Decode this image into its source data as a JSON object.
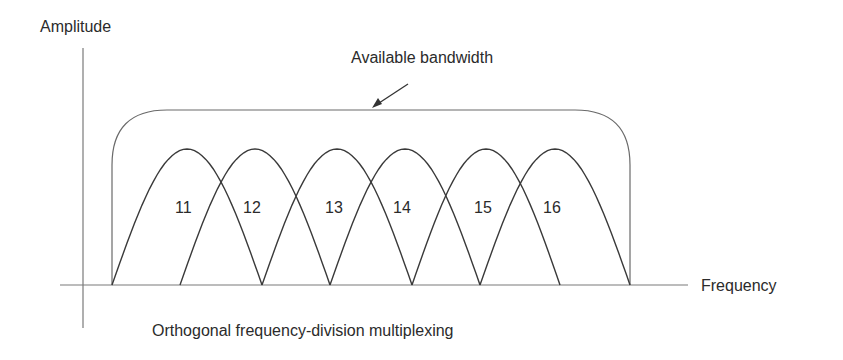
{
  "diagram": {
    "caption": "Orthogonal frequency-division multiplexing",
    "y_axis_label": "Amplitude",
    "x_axis_label": "Frequency",
    "annotation": "Available bandwidth",
    "subcarriers": [
      {
        "label": "11",
        "start": 0,
        "end": 2
      },
      {
        "label": "12",
        "start": 1,
        "end": 3
      },
      {
        "label": "13",
        "start": 2,
        "end": 4
      },
      {
        "label": "14",
        "start": 3,
        "end": 5
      },
      {
        "label": "15",
        "start": 4,
        "end": 6
      },
      {
        "label": "16",
        "start": 5,
        "end": 7
      }
    ],
    "bandwidth": {
      "start": 0,
      "end": 7
    },
    "colors": {
      "line": "#3a3a3a",
      "envelope": "#6a6a6a",
      "axis": "#777777",
      "text": "#2b2b2b"
    }
  }
}
